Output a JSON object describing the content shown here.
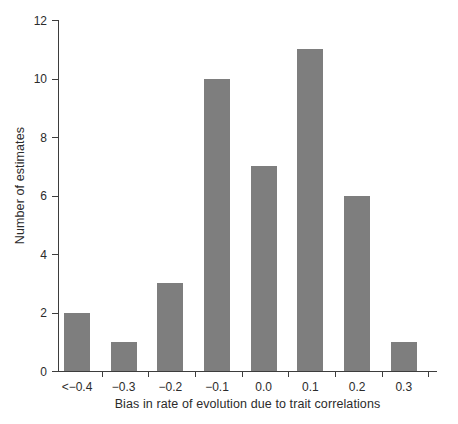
{
  "chart_data": {
    "type": "bar",
    "title": "",
    "subtitle": "",
    "xlabel": "Bias in rate of evolution due to trait correlations",
    "ylabel": "Number of estimates",
    "categories": [
      "<−0.4",
      "−0.3",
      "−0.2",
      "−0.1",
      "0.0",
      "0.1",
      "0.2",
      "0.3"
    ],
    "values": [
      2,
      1,
      3,
      10,
      7,
      11,
      6,
      1
    ],
    "ylim": [
      0,
      12
    ],
    "ytick_values": [
      0,
      2,
      4,
      6,
      8,
      10,
      12
    ],
    "ytick_labels": [
      "0",
      "2",
      "4",
      "6",
      "8",
      "10",
      "12"
    ],
    "grid": false,
    "legend": null,
    "legend_position": "none",
    "bar_color": "#7e7e7e",
    "axis_color": "#3d3d3d",
    "text_color": "#2b2b2b",
    "background_color": "#ffffff",
    "annotations": []
  }
}
